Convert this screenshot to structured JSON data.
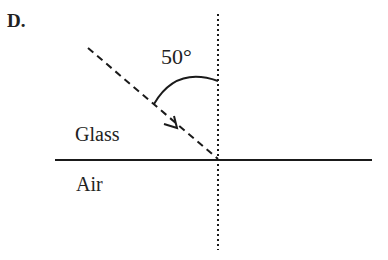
{
  "option_label": "D.",
  "diagram": {
    "angle_label": "50°",
    "upper_medium": "Glass",
    "lower_medium": "Air",
    "elements": {
      "normal_line": {
        "style": "dotted",
        "x": 218,
        "y1": 14,
        "y2": 250
      },
      "boundary_line": {
        "style": "solid",
        "y": 160,
        "x1": 55,
        "x2": 372
      },
      "incident_ray": {
        "style": "dashed",
        "x1": 88,
        "y1": 48,
        "x2": 218,
        "y2": 159,
        "arrow_direction": "toward boundary"
      },
      "angle_arc": {
        "from": "ray",
        "to": "normal",
        "value_deg": 50
      }
    },
    "colors": {
      "line": "#1a1a1a",
      "background": "#ffffff"
    }
  }
}
